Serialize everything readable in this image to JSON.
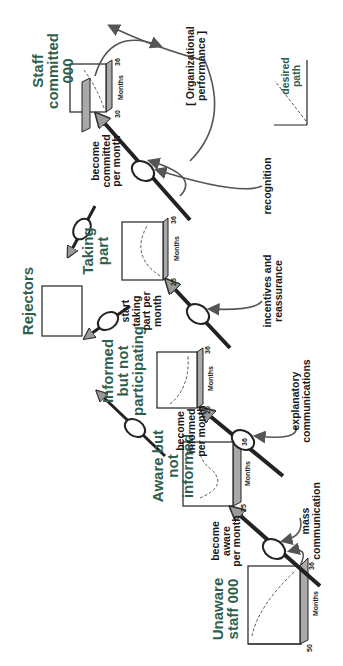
{
  "diagram": {
    "orientation": "rotated 90deg counter-clockwise",
    "colors": {
      "stock_label": "#2f5f4f",
      "arrow": "#555555",
      "box_side": "#a9a9a9",
      "text": "#1a1a1a"
    },
    "stocks": [
      {
        "id": "unaware",
        "label": "Unaware\nstaff 000",
        "y_max": "50",
        "x_min": "0",
        "x_max": "36",
        "x_label": "Months",
        "curve": "rising-convex"
      },
      {
        "id": "aware",
        "label": "Aware but\nnot\ninformed",
        "y_max": "25",
        "x_min": "",
        "x_max": "36",
        "x_label": "Months",
        "curve": "hump"
      },
      {
        "id": "informed",
        "label": "Informed\nbut not\nparticipating",
        "y_max": "25",
        "x_min": "0",
        "x_max": "36",
        "x_label": "Months",
        "curve": "rise-plateau"
      },
      {
        "id": "taking-part",
        "label": "Taking\npart",
        "y_max": "25",
        "x_min": "0",
        "x_max": "36",
        "x_label": "Months",
        "curve": "rise-plateau"
      },
      {
        "id": "committed",
        "label": "Staff\ncommitted\n000",
        "y_max": "30",
        "x_min": "0",
        "x_max": "36",
        "x_label": "Months",
        "curve": "linear-rise"
      },
      {
        "id": "rejectors",
        "label": "Rejectors"
      }
    ],
    "flows": [
      {
        "id": "become-aware",
        "label": "become\naware\nper month"
      },
      {
        "id": "become-informed",
        "label": "become\ninformed\nper month"
      },
      {
        "id": "start-taking-part",
        "label": "start\ntaking\npart per\nmonth"
      },
      {
        "id": "become-committed",
        "label": "become\ncommitted\nper month"
      }
    ],
    "influences": [
      {
        "id": "mass-communication",
        "label": "mass\ncommunication"
      },
      {
        "id": "explanatory-communications",
        "label": "explanatory\ncommunications"
      },
      {
        "id": "incentives",
        "label": "incentives and\nreassurance"
      },
      {
        "id": "recognition",
        "label": "recognition"
      },
      {
        "id": "org-performance",
        "label": "[ Organizational\nperformance ]"
      }
    ],
    "legend": {
      "label": "desired\npath"
    }
  }
}
